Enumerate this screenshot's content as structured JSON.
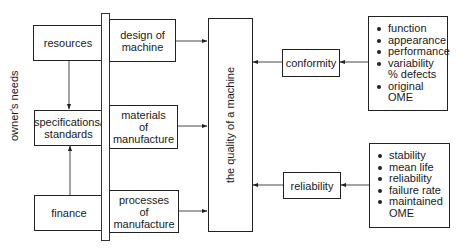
{
  "diagram": {
    "side_label": "owner's needs",
    "left_boxes": [
      {
        "id": "resources",
        "label": "resources"
      },
      {
        "id": "specifications",
        "lines": [
          "specifications/",
          "standards"
        ]
      },
      {
        "id": "finance",
        "label": "finance"
      }
    ],
    "middle_boxes": [
      {
        "id": "design",
        "lines": [
          "design of",
          "machine"
        ]
      },
      {
        "id": "materials",
        "lines": [
          "materials",
          "of",
          "manufacture"
        ]
      },
      {
        "id": "processes",
        "lines": [
          "processes",
          "of",
          "manufacture"
        ]
      }
    ],
    "center_box": {
      "label": "the quality of a machine"
    },
    "right_boxes": [
      {
        "id": "conformity",
        "label": "conformity"
      },
      {
        "id": "reliability",
        "label": "reliability"
      }
    ],
    "conformity_list": [
      {
        "text": "function"
      },
      {
        "text": "appearance"
      },
      {
        "text": "performance"
      },
      {
        "text": "variability",
        "cont": "% defects"
      },
      {
        "text": "original",
        "cont": "OME"
      }
    ],
    "reliability_list": [
      {
        "text": "stability"
      },
      {
        "text": "mean life"
      },
      {
        "text": "reliability"
      },
      {
        "text": "failure rate"
      },
      {
        "text": "maintained",
        "cont": "OME"
      }
    ],
    "edges": [
      {
        "from": "resources",
        "to": "specifications"
      },
      {
        "from": "finance",
        "to": "specifications"
      },
      {
        "from": "design",
        "to": "center_box"
      },
      {
        "from": "materials",
        "to": "center_box"
      },
      {
        "from": "processes",
        "to": "center_box"
      },
      {
        "from": "conformity",
        "to": "center_box"
      },
      {
        "from": "reliability",
        "to": "center_box"
      },
      {
        "from": "conformity_list",
        "to": "conformity"
      },
      {
        "from": "reliability_list",
        "to": "reliability"
      }
    ],
    "colors": {
      "line": "#222222",
      "background": "#ffffff"
    }
  }
}
